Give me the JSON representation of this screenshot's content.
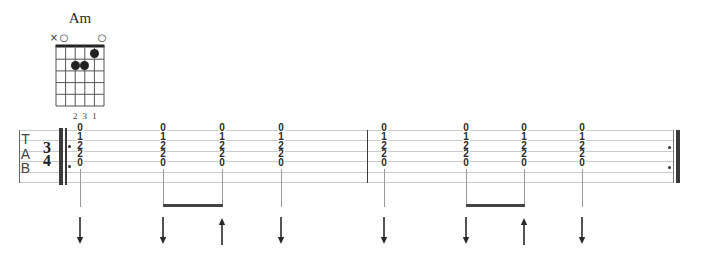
{
  "chord_diagram": {
    "name": "Am",
    "string_markers": [
      "×",
      "○",
      "",
      "",
      "",
      "○"
    ],
    "finger_labels": [
      "",
      "",
      "2",
      "3",
      "1",
      ""
    ],
    "dots": [
      {
        "string": 3,
        "fret": 2,
        "finger": "2"
      },
      {
        "string": 4,
        "fret": 2,
        "finger": "3"
      },
      {
        "string": 5,
        "fret": 1,
        "finger": "1"
      }
    ],
    "frets_shown": 5
  },
  "tablature": {
    "clef": {
      "t": "T",
      "a": "A",
      "b": "B"
    },
    "time_signature": {
      "numerator": "3",
      "denominator": "4"
    },
    "barlines": [
      "start-repeat",
      "single",
      "end-repeat"
    ],
    "events": [
      {
        "frets": [
          "0",
          "1",
          "2",
          "2",
          "0"
        ],
        "strum": "down"
      },
      {
        "frets": [
          "0",
          "1",
          "2",
          "2",
          "0"
        ],
        "strum": "down"
      },
      {
        "frets": [
          "0",
          "1",
          "2",
          "2",
          "0"
        ],
        "strum": "up"
      },
      {
        "frets": [
          "0",
          "1",
          "2",
          "2",
          "0"
        ],
        "strum": "down"
      },
      {
        "frets": [
          "0",
          "1",
          "2",
          "2",
          "0"
        ],
        "strum": "down"
      },
      {
        "frets": [
          "0",
          "1",
          "2",
          "2",
          "0"
        ],
        "strum": "down"
      },
      {
        "frets": [
          "0",
          "1",
          "2",
          "2",
          "0"
        ],
        "strum": "up"
      },
      {
        "frets": [
          "0",
          "1",
          "2",
          "2",
          "0"
        ],
        "strum": "down"
      }
    ],
    "beams": [
      [
        1,
        2
      ],
      [
        5,
        6
      ]
    ]
  },
  "colors": {
    "ink": "#2a2a2a",
    "staff_line": "#cbcbcb",
    "stem": "#9a9a9a"
  }
}
